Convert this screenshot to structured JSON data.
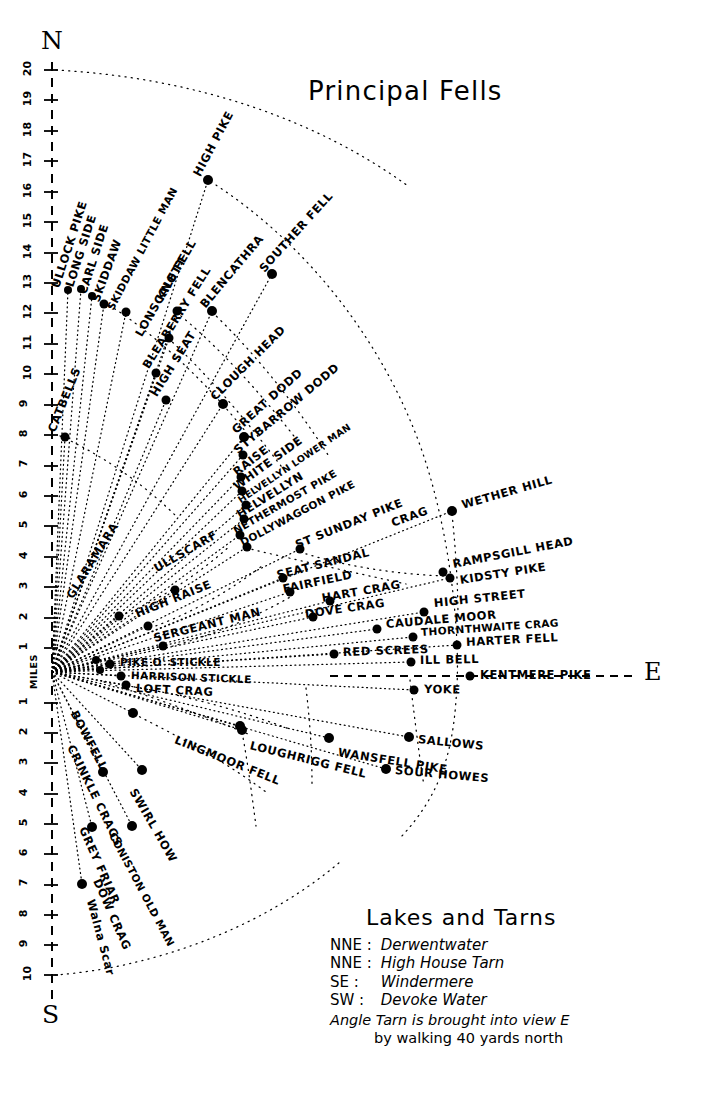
{
  "title": "Principal Fells",
  "cardinals": {
    "north": "N",
    "south": "S",
    "east": "E"
  },
  "scale": {
    "unit_label": "MILES",
    "north_ticks": [
      20,
      19,
      18,
      17,
      16,
      15,
      14,
      13,
      12,
      11,
      10,
      9,
      8,
      7,
      6,
      5,
      4,
      3,
      2,
      1
    ],
    "south_ticks": [
      1,
      2,
      3,
      4,
      5,
      6,
      7,
      8,
      9,
      10
    ]
  },
  "chart_data": {
    "type": "scatter",
    "title": "Principal Fells",
    "xlabel": "",
    "ylabel": "MILES",
    "grid": false,
    "legend_position": "bottom-right",
    "center_px": [
      52,
      672
    ],
    "points": [
      {
        "name": "ULLOCK PIKE",
        "x": 68,
        "y": 290,
        "label_x": 56,
        "label_y": 288,
        "rot": -72
      },
      {
        "name": "LONG SIDE",
        "x": 81,
        "y": 289,
        "label_x": 70,
        "label_y": 287,
        "rot": -72
      },
      {
        "name": "CARL SIDE",
        "x": 92,
        "y": 296,
        "label_x": 83,
        "label_y": 294,
        "rot": -72
      },
      {
        "name": "SKIDDAW",
        "x": 104,
        "y": 304,
        "label_x": 96,
        "label_y": 302,
        "rot": -70
      },
      {
        "name": "SKIDDAW LITTLE MAN",
        "x": 126,
        "y": 312,
        "label_x": 110,
        "label_y": 310,
        "rot": -62
      },
      {
        "name": "LONSCALE FELL",
        "x": 169,
        "y": 338,
        "label_x": 139,
        "label_y": 336,
        "rot": -60
      },
      {
        "name": "KNOTT",
        "x": 177,
        "y": 311,
        "label_x": 160,
        "label_y": 300,
        "rot": -60
      },
      {
        "name": "HIGH PIKE",
        "x": 208,
        "y": 180,
        "label_x": 197,
        "label_y": 176,
        "rot": -62
      },
      {
        "name": "BLENCATHRA",
        "x": 212,
        "y": 311,
        "label_x": 203,
        "label_y": 307,
        "rot": -50
      },
      {
        "name": "SOUTHER FELL",
        "x": 272,
        "y": 274,
        "label_x": 262,
        "label_y": 271,
        "rot": -48
      },
      {
        "name": "BLEABERRY FELL",
        "x": 156,
        "y": 373,
        "label_x": 146,
        "label_y": 368,
        "rot": -58
      },
      {
        "name": "HIGH SEAT",
        "x": 166,
        "y": 400,
        "label_x": 154,
        "label_y": 396,
        "rot": -58
      },
      {
        "name": "CLOUGH HEAD",
        "x": 223,
        "y": 404,
        "label_x": 213,
        "label_y": 399,
        "rot": -45
      },
      {
        "name": "GREAT DODD",
        "x": 244,
        "y": 437,
        "label_x": 234,
        "label_y": 432,
        "rot": -42
      },
      {
        "name": "STYBARROW DODD",
        "x": 243,
        "y": 455,
        "label_x": 236,
        "label_y": 452,
        "rot": -40
      },
      {
        "name": "RAISE",
        "x": 241,
        "y": 477,
        "label_x": 235,
        "label_y": 474,
        "rot": -38
      },
      {
        "name": "WHITE SIDE",
        "x": 242,
        "y": 491,
        "label_x": 235,
        "label_y": 488,
        "rot": -36
      },
      {
        "name": "HELVELLYN LOWER MAN",
        "x": 246,
        "y": 505,
        "label_x": 239,
        "label_y": 502,
        "rot": -34
      },
      {
        "name": "HELVELLYN",
        "x": 244,
        "y": 519,
        "label_x": 238,
        "label_y": 516,
        "rot": -32
      },
      {
        "name": "NETHERMOST PIKE",
        "x": 240,
        "y": 535,
        "label_x": 234,
        "label_y": 532,
        "rot": -30
      },
      {
        "name": "DOLLYWAGGON PIKE",
        "x": 247,
        "y": 547,
        "label_x": 241,
        "label_y": 544,
        "rot": -28
      },
      {
        "name": "ST SUNDAY PIKE",
        "x": 300,
        "y": 549,
        "label_x": 296,
        "label_y": 546,
        "rot": -22
      },
      {
        "name": "CRAG",
        "x": 430,
        "y": 512,
        "label_x": 392,
        "label_y": 524,
        "rot": -20
      },
      {
        "name": "WETHER HILL",
        "x": 452,
        "y": 511,
        "label_x": 462,
        "label_y": 506,
        "rot": -16
      },
      {
        "name": "GLARAMARA",
        "x": 119,
        "y": 616,
        "label_x": 70,
        "label_y": 598,
        "rot": -58
      },
      {
        "name": "CATBELLS",
        "x": 65,
        "y": 437,
        "label_x": 52,
        "label_y": 432,
        "rot": -68
      },
      {
        "name": "ULLSCARF",
        "x": 175,
        "y": 590,
        "label_x": 155,
        "label_y": 570,
        "rot": -30
      },
      {
        "name": "HIGH RAISE",
        "x": 148,
        "y": 626,
        "label_x": 136,
        "label_y": 615,
        "rot": -22
      },
      {
        "name": "SERGEANT MAN",
        "x": 163,
        "y": 646,
        "label_x": 154,
        "label_y": 639,
        "rot": -14
      },
      {
        "name": "SEAT SANDAL",
        "x": 283,
        "y": 578,
        "label_x": 277,
        "label_y": 576,
        "rot": -14
      },
      {
        "name": "FAIRFIELD",
        "x": 290,
        "y": 592,
        "label_x": 283,
        "label_y": 590,
        "rot": -12
      },
      {
        "name": "HART CRAG",
        "x": 330,
        "y": 601,
        "label_x": 322,
        "label_y": 599,
        "rot": -10
      },
      {
        "name": "DOVE CRAG",
        "x": 313,
        "y": 617,
        "label_x": 305,
        "label_y": 615,
        "rot": -8
      },
      {
        "name": "RAMPSGILL HEAD",
        "x": 443,
        "y": 572,
        "label_x": 453,
        "label_y": 565,
        "rot": -11
      },
      {
        "name": "KIDSTY PIKE",
        "x": 450,
        "y": 578,
        "label_x": 460,
        "label_y": 581,
        "rot": -9
      },
      {
        "name": "HIGH STREET",
        "x": 424,
        "y": 612,
        "label_x": 434,
        "label_y": 604,
        "rot": -6
      },
      {
        "name": "CAUDALE MOOR",
        "x": 377,
        "y": 629,
        "label_x": 386,
        "label_y": 625,
        "rot": -5
      },
      {
        "name": "THORNTHWAITE CRAG",
        "x": 413,
        "y": 637,
        "label_x": 421,
        "label_y": 633,
        "rot": -4
      },
      {
        "name": "HARTER FELL",
        "x": 457,
        "y": 645,
        "label_x": 466,
        "label_y": 643,
        "rot": -3
      },
      {
        "name": "RED SCREES",
        "x": 334,
        "y": 654,
        "label_x": 343,
        "label_y": 653,
        "rot": -2
      },
      {
        "name": "ILL BELL",
        "x": 411,
        "y": 662,
        "label_x": 420,
        "label_y": 661,
        "rot": -1
      },
      {
        "name": "KENTMERE PIKE",
        "x": 470,
        "y": 676,
        "label_x": 480,
        "label_y": 676,
        "rot": 0
      },
      {
        "name": "PIKE O' STICKLE",
        "x": 110,
        "y": 664,
        "label_x": 120,
        "label_y": 663,
        "rot": 0
      },
      {
        "name": "HARRISON STICKLE",
        "x": 121,
        "y": 676,
        "label_x": 131,
        "label_y": 676,
        "rot": 2
      },
      {
        "name": "LOFT CRAG",
        "x": 126,
        "y": 685,
        "label_x": 136,
        "label_y": 689,
        "rot": 3
      },
      {
        "name": "YOKE",
        "x": 414,
        "y": 690,
        "label_x": 424,
        "label_y": 690,
        "rot": 1
      },
      {
        "name": "BOWFELL",
        "x": 133,
        "y": 713,
        "label_x": 73,
        "label_y": 712,
        "rot": 62
      },
      {
        "name": "CRINKLE CRAGS",
        "x": 103,
        "y": 772,
        "label_x": 70,
        "label_y": 746,
        "rot": 64
      },
      {
        "name": "GREY FRIAR",
        "x": 92,
        "y": 827,
        "label_x": 82,
        "label_y": 828,
        "rot": 66
      },
      {
        "name": "DOW CRAG",
        "x": 82,
        "y": 884,
        "label_x": 96,
        "label_y": 880,
        "rot": 66
      },
      {
        "name": "SWIRL HOW",
        "x": 142,
        "y": 770,
        "label_x": 132,
        "label_y": 790,
        "rot": 60
      },
      {
        "name": "CONISTON OLD MAN",
        "x": 132,
        "y": 826,
        "label_x": 112,
        "label_y": 834,
        "rot": 62
      },
      {
        "name": "Walna Scar",
        "x": 0,
        "y": 0,
        "label_x": 90,
        "label_y": 900,
        "rot": 75
      },
      {
        "name": "LINGMOOR FELL",
        "x": 242,
        "y": 730,
        "label_x": 175,
        "label_y": 740,
        "rot": 22
      },
      {
        "name": "LOUGHRIGG FELL",
        "x": 240,
        "y": 726,
        "label_x": 250,
        "label_y": 746,
        "rot": 14
      },
      {
        "name": "WANSFELL PIKE",
        "x": 329,
        "y": 738,
        "label_x": 338,
        "label_y": 753,
        "rot": 9
      },
      {
        "name": "SALLOWS",
        "x": 409,
        "y": 737,
        "label_x": 418,
        "label_y": 740,
        "rot": 6
      },
      {
        "name": "SOUR HOWES",
        "x": 386,
        "y": 769,
        "label_x": 395,
        "label_y": 771,
        "rot": 5
      }
    ]
  },
  "fells": [
    "ULLOCK PIKE",
    "LONG SIDE",
    "CARL SIDE",
    "SKIDDAW",
    "SKIDDAW LITTLE MAN",
    "LONSCALE FELL",
    "KNOTT",
    "HIGH PIKE",
    "BLENCATHRA",
    "SOUTHER FELL",
    "BLEABERRY FELL",
    "HIGH SEAT",
    "CLOUGH HEAD",
    "GREAT DODD",
    "STYBARROW DODD",
    "RAISE",
    "WHITE SIDE",
    "HELVELLYN LOWER MAN",
    "HELVELLYN",
    "NETHERMOST PIKE",
    "DOLLYWAGGON PIKE",
    "ST SUNDAY PIKE",
    "CRAG",
    "WETHER HILL",
    "GLARAMARA",
    "CATBELLS",
    "ULLSCARF",
    "HIGH RAISE",
    "SERGEANT MAN",
    "SEAT SANDAL",
    "FAIRFIELD",
    "HART CRAG",
    "DOVE CRAG",
    "RAMPSGILL HEAD",
    "KIDSTY PIKE",
    "HIGH STREET",
    "CAUDALE MOOR",
    "THORNTHWAITE CRAG",
    "HARTER FELL",
    "RED SCREES",
    "ILL BELL",
    "KENTMERE PIKE",
    "PIKE O' STICKLE",
    "HARRISON STICKLE",
    "LOFT CRAG",
    "YOKE",
    "BOWFELL",
    "CRINKLE CRAGS",
    "GREY FRIAR",
    "DOW CRAG",
    "SWIRL HOW",
    "CONISTON OLD MAN",
    "Walna Scar",
    "LINGMOOR FELL",
    "LOUGHRIGG FELL",
    "WANSFELL PIKE",
    "SALLOWS",
    "SOUR HOWES"
  ],
  "legend": {
    "heading": "Lakes and Tarns",
    "entries": [
      {
        "bearing": "NNE :",
        "name": "Derwentwater"
      },
      {
        "bearing": "NNE :",
        "name": "High House Tarn"
      },
      {
        "bearing": "SE :",
        "name": "Windermere"
      },
      {
        "bearing": "SW :",
        "name": "Devoke Water"
      }
    ],
    "note_line1": "Angle Tarn is brought into view E",
    "note_line2": "by walking 40 yards north"
  }
}
